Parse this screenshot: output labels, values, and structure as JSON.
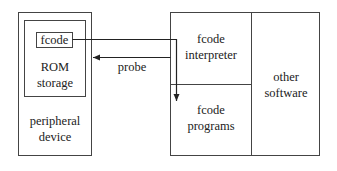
{
  "diagram": {
    "peripheral_device": {
      "label_line1": "peripheral",
      "label_line2": "device"
    },
    "rom_storage": {
      "label_line1": "ROM",
      "label_line2": "storage"
    },
    "fcode_box": {
      "label": "fcode"
    },
    "probe_arrow": {
      "label": "probe"
    },
    "fcode_interpreter": {
      "label_line1": "fcode",
      "label_line2": "interpreter"
    },
    "fcode_programs": {
      "label_line1": "fcode",
      "label_line2": "programs"
    },
    "other_software": {
      "label_line1": "other",
      "label_line2": "software"
    },
    "colors": {
      "stroke": "#333333",
      "background": "#ffffff"
    }
  }
}
